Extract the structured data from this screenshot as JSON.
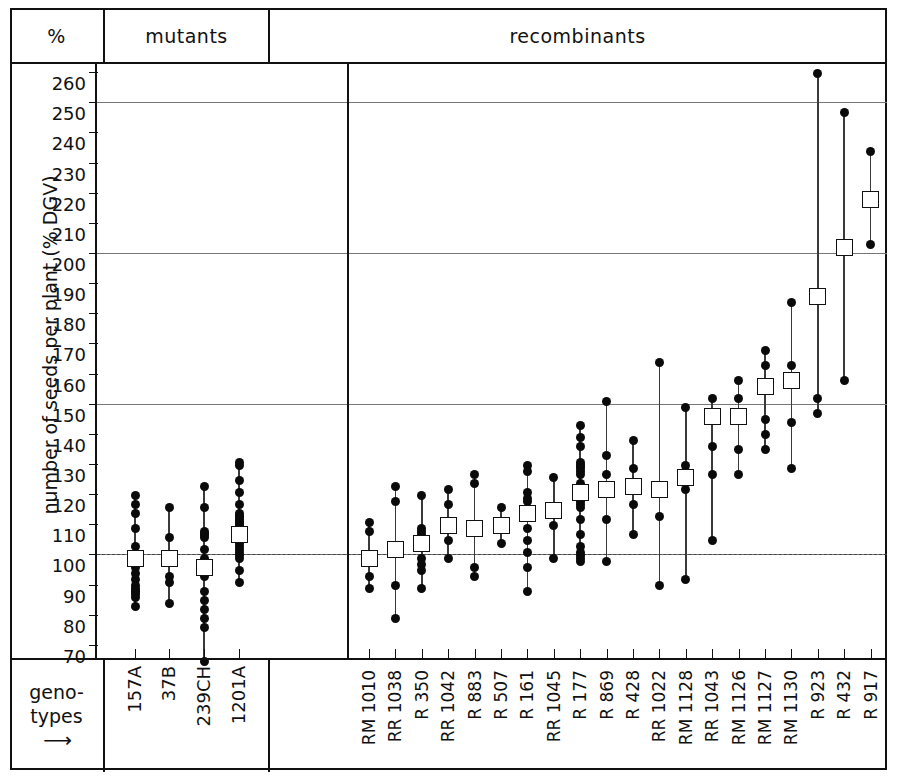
{
  "header": {
    "axis_col_label": "%",
    "panel_mutants": "mutants",
    "panel_recombinants": "recombinants"
  },
  "footer": {
    "geno_line1": "geno-",
    "geno_line2": "types",
    "geno_arrow": "⟶"
  },
  "chart_data": {
    "type": "scatter",
    "title": "",
    "xlabel": "genotypes",
    "ylabel": "number of seeds per plant (% DGV)",
    "ylim": [
      66,
      263
    ],
    "yticks": [
      70,
      80,
      90,
      100,
      110,
      120,
      130,
      140,
      150,
      160,
      170,
      180,
      190,
      200,
      210,
      220,
      230,
      240,
      250,
      260
    ],
    "gridlines": [
      100,
      150,
      200,
      250
    ],
    "baseline": 100,
    "grid": true,
    "legend_position": "none",
    "marker_individual": "filled-circle",
    "marker_mean": "open-square",
    "panels": [
      {
        "name": "mutants",
        "groups": [
          {
            "label": "157A",
            "mean": 99,
            "min": 83,
            "max": 120,
            "values": [
              120,
              117,
              114,
              109,
              103,
              99,
              96,
              94,
              92,
              90,
              89,
              88,
              88,
              87,
              86,
              83
            ]
          },
          {
            "label": "37B",
            "mean": 99,
            "min": 84,
            "max": 116,
            "values": [
              116,
              106,
              99,
              93,
              91,
              84
            ]
          },
          {
            "label": "239CH",
            "mean": 96,
            "min": 65,
            "max": 123,
            "values": [
              123,
              116,
              108,
              107,
              107,
              106,
              102,
              99,
              98,
              97,
              97,
              96,
              95,
              93,
              88,
              85,
              82,
              79,
              76,
              65
            ]
          },
          {
            "label": "1201A",
            "mean": 107,
            "min": 91,
            "max": 131,
            "values": [
              131,
              130,
              125,
              121,
              117,
              114,
              113,
              113,
              112,
              111,
              111,
              110,
              109,
              108,
              107,
              107,
              106,
              105,
              104,
              103,
              102,
              101,
              100,
              99,
              95,
              91
            ]
          }
        ]
      },
      {
        "name": "recombinants",
        "groups": [
          {
            "label": "RM 1010",
            "mean": 99,
            "min": 89,
            "max": 111,
            "values": [
              111,
              108,
              99,
              93,
              89
            ]
          },
          {
            "label": "RR 1038",
            "mean": 102,
            "min": 79,
            "max": 123,
            "values": [
              123,
              118,
              102,
              90,
              79
            ]
          },
          {
            "label": "R 350",
            "mean": 104,
            "min": 89,
            "max": 120,
            "values": [
              120,
              109,
              108,
              107,
              104,
              99,
              97,
              95,
              89
            ]
          },
          {
            "label": "RR 1042",
            "mean": 110,
            "min": 99,
            "max": 122,
            "values": [
              122,
              117,
              110,
              105,
              99
            ]
          },
          {
            "label": "R 883",
            "mean": 109,
            "min": 93,
            "max": 127,
            "values": [
              127,
              124,
              109,
              96,
              93
            ]
          },
          {
            "label": "R 507",
            "mean": 110,
            "min": 104,
            "max": 116,
            "values": [
              116,
              110,
              104
            ]
          },
          {
            "label": "R 161",
            "mean": 114,
            "min": 88,
            "max": 130,
            "values": [
              130,
              128,
              121,
              119,
              118,
              114,
              109,
              105,
              101,
              96,
              88
            ]
          },
          {
            "label": "RR 1045",
            "mean": 115,
            "min": 99,
            "max": 126,
            "values": [
              126,
              115,
              110,
              99
            ]
          },
          {
            "label": "R 177",
            "mean": 121,
            "min": 98,
            "max": 143,
            "values": [
              143,
              139,
              136,
              131,
              130,
              130,
              129,
              128,
              127,
              124,
              121,
              119,
              118,
              117,
              116,
              112,
              107,
              103,
              101,
              100,
              99,
              98
            ]
          },
          {
            "label": "R 869",
            "mean": 122,
            "min": 98,
            "max": 151,
            "values": [
              151,
              133,
              127,
              121,
              112,
              98
            ]
          },
          {
            "label": "R 428",
            "mean": 123,
            "min": 107,
            "max": 138,
            "values": [
              138,
              129,
              123,
              117,
              107
            ]
          },
          {
            "label": "RR 1022",
            "mean": 122,
            "min": 90,
            "max": 164,
            "values": [
              164,
              122,
              113,
              90
            ]
          },
          {
            "label": "RM 1128",
            "mean": 126,
            "min": 92,
            "max": 149,
            "values": [
              149,
              130,
              128,
              122,
              92
            ]
          },
          {
            "label": "RR 1043",
            "mean": 146,
            "min": 105,
            "max": 152,
            "values": [
              152,
              146,
              136,
              127,
              105
            ]
          },
          {
            "label": "RM 1126",
            "mean": 146,
            "min": 127,
            "max": 158,
            "values": [
              158,
              152,
              146,
              135,
              127
            ]
          },
          {
            "label": "RM 1127",
            "mean": 156,
            "min": 135,
            "max": 168,
            "values": [
              168,
              163,
              156,
              145,
              140,
              135
            ]
          },
          {
            "label": "RM 1130",
            "mean": 158,
            "min": 129,
            "max": 184,
            "values": [
              184,
              163,
              158,
              144,
              129
            ]
          },
          {
            "label": "R 923",
            "mean": 186,
            "min": 147,
            "max": 260,
            "values": [
              260,
              186,
              152,
              147
            ]
          },
          {
            "label": "R 432",
            "mean": 202,
            "min": 158,
            "max": 247,
            "values": [
              247,
              202,
              158
            ]
          },
          {
            "label": "R 917",
            "mean": 218,
            "min": 203,
            "max": 234,
            "values": [
              234,
              218,
              203
            ]
          }
        ]
      }
    ]
  }
}
